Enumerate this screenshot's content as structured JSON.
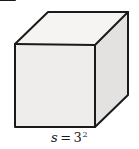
{
  "figure": {
    "name": "cube-diagram",
    "type": "geometric-solid",
    "solid": "cube",
    "background_color": "#ffffff",
    "stroke_color": "#1a1a1a",
    "stroke_width": 2,
    "faces": {
      "top": {
        "name": "top-face",
        "fill": "#f5f4f2",
        "points": "15,44 48,12 128,12 95,45"
      },
      "front": {
        "name": "front-face",
        "fill": "#eeedeb",
        "points": "15,44 95,45 95,127 15,127"
      },
      "right": {
        "name": "right-face",
        "fill": "#e3e2e0",
        "points": "95,45 128,12 128,95 95,127"
      }
    },
    "edges": [
      {
        "name": "edge-top-front",
        "x1": 15,
        "y1": 44,
        "x2": 95,
        "y2": 45
      },
      {
        "name": "edge-top-back",
        "x1": 48,
        "y1": 12,
        "x2": 128,
        "y2": 12
      },
      {
        "name": "edge-top-left",
        "x1": 15,
        "y1": 44,
        "x2": 48,
        "y2": 12
      },
      {
        "name": "edge-top-right",
        "x1": 95,
        "y1": 45,
        "x2": 128,
        "y2": 12
      },
      {
        "name": "edge-front-left",
        "x1": 15,
        "y1": 44,
        "x2": 15,
        "y2": 127
      },
      {
        "name": "edge-front-right",
        "x1": 95,
        "y1": 45,
        "x2": 95,
        "y2": 127
      },
      {
        "name": "edge-front-bottom",
        "x1": 15,
        "y1": 127,
        "x2": 95,
        "y2": 127
      },
      {
        "name": "edge-side-right",
        "x1": 128,
        "y1": 12,
        "x2": 128,
        "y2": 95
      },
      {
        "name": "edge-side-bottom",
        "x1": 95,
        "y1": 127,
        "x2": 128,
        "y2": 95
      }
    ]
  },
  "label": {
    "name": "side-length-label",
    "full_text": "s = 3²",
    "variable": "s",
    "equals": "=",
    "base": "3",
    "exponent": "2"
  }
}
